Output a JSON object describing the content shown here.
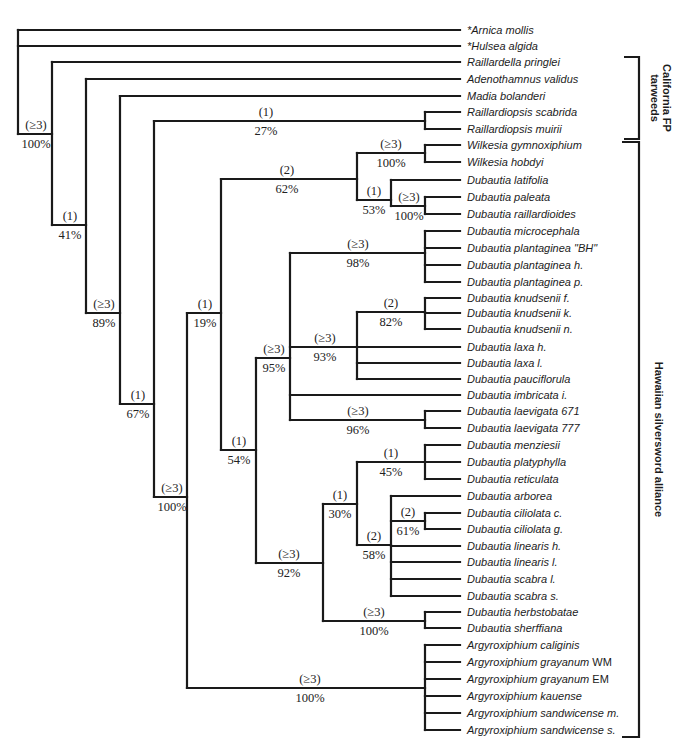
{
  "figure": {
    "type": "phylogenetic-cladogram",
    "support_legend": {
      "decay_index_format": "(n)",
      "bootstrap_format": "n%"
    }
  },
  "leaves": [
    {
      "id": "arnica",
      "label": "*Arnica mollis",
      "y": 30
    },
    {
      "id": "hulsea",
      "label": "*Hulsea algida",
      "y": 46
    },
    {
      "id": "raillardella",
      "label": "Raillardella pringlei",
      "y": 62
    },
    {
      "id": "adenothamnus",
      "label": "Adenothamnus validus",
      "y": 79
    },
    {
      "id": "madia",
      "label": "Madia bolanderi",
      "y": 96
    },
    {
      "id": "rscabrida",
      "label": "Raillardiopsis scabrida",
      "y": 112
    },
    {
      "id": "rmuirii",
      "label": "Raillardiopsis muirii",
      "y": 129
    },
    {
      "id": "wgymno",
      "label": "Wilkesia gymnoxiphium",
      "y": 145
    },
    {
      "id": "whobdyi",
      "label": "Wilkesia hobdyi",
      "y": 162
    },
    {
      "id": "dlatifolia",
      "label": "Dubautia latifolia",
      "y": 180
    },
    {
      "id": "dpaleata",
      "label": "Dubautia paleata",
      "y": 197
    },
    {
      "id": "draill",
      "label": "Dubautia  raillardioides",
      "y": 214
    },
    {
      "id": "dmicro",
      "label": "Dubautia microcephala",
      "y": 231
    },
    {
      "id": "dplantBH",
      "label": "Dubautia plantaginea \"BH\"",
      "y": 248
    },
    {
      "id": "dplanth",
      "label": "Dubautia plantaginea h.",
      "y": 265
    },
    {
      "id": "dplantp",
      "label": "Dubautia plantaginea p.",
      "y": 282
    },
    {
      "id": "dknudf",
      "label": "Dubautia knudsenii f.",
      "y": 298
    },
    {
      "id": "dknudk",
      "label": "Dubautia knudsenii k.",
      "y": 313
    },
    {
      "id": "dknudn",
      "label": "Dubautia knudsenii n.",
      "y": 329
    },
    {
      "id": "dlaxah",
      "label": "Dubautia laxa h.",
      "y": 347
    },
    {
      "id": "dlaxal",
      "label": "Dubautia laxa l.",
      "y": 363
    },
    {
      "id": "dpauci",
      "label": "Dubautia pauciflorula",
      "y": 379
    },
    {
      "id": "dimbric",
      "label": "Dubautia imbricata i.",
      "y": 395
    },
    {
      "id": "dlaev671",
      "label": "Dubautia laevigata 671",
      "y": 411
    },
    {
      "id": "dlaev777",
      "label": "Dubautia laevigata 777",
      "y": 428
    },
    {
      "id": "dmenz",
      "label": "Dubautia menziesii",
      "y": 445
    },
    {
      "id": "dplaty",
      "label": "Dubautia platyphylla",
      "y": 462
    },
    {
      "id": "dretic",
      "label": "Dubautia reticulata",
      "y": 479
    },
    {
      "id": "darbor",
      "label": "Dubautia arborea",
      "y": 496
    },
    {
      "id": "dcilc",
      "label": "Dubautia ciliolata c.",
      "y": 513
    },
    {
      "id": "dcilg",
      "label": "Dubautia ciliolata g.",
      "y": 529
    },
    {
      "id": "dlinh",
      "label": "Dubautia linearis h.",
      "y": 546
    },
    {
      "id": "dlinl",
      "label": "Dubautia linearis l.",
      "y": 562
    },
    {
      "id": "dscabl",
      "label": "Dubautia scabra l.",
      "y": 579
    },
    {
      "id": "dscabs",
      "label": "Dubautia scabra s.",
      "y": 596
    },
    {
      "id": "dherb",
      "label": "Dubautia herbstobatae",
      "y": 612
    },
    {
      "id": "dsherf",
      "label": "Dubautia sherffiana",
      "y": 628
    },
    {
      "id": "acalig",
      "label": "Argyroxiphium caliginis",
      "y": 645
    },
    {
      "id": "agrayWM",
      "label": "Argyroxiphium grayanum",
      "suffix": " WM",
      "y": 662
    },
    {
      "id": "agrayEM",
      "label": "Argyroxiphium grayanum",
      "suffix": " EM",
      "y": 679
    },
    {
      "id": "akau",
      "label": "Argyroxiphium kauense",
      "y": 696
    },
    {
      "id": "asandm",
      "label": "Argyroxiphium sandwicense m.",
      "y": 713
    },
    {
      "id": "asands",
      "label": "Argyroxiphium sandwicense s.",
      "y": 730
    }
  ],
  "leaf_line_end_x": 460,
  "label_x": 467,
  "nodes": [
    {
      "id": "root",
      "x": 18,
      "y1": 30,
      "y2": 134,
      "children": [
        "leaf:arnica",
        "leaf:hulsea",
        "node:n100a"
      ]
    },
    {
      "id": "n100a",
      "x": 52,
      "y1": 62,
      "y2": 225,
      "stem_y": 134,
      "decay": "(≥3)",
      "bootstrap": "100%",
      "children": [
        "leaf:raillardella",
        "node:n41"
      ]
    },
    {
      "id": "n41",
      "x": 86,
      "y1": 79,
      "y2": 313,
      "stem_y": 225,
      "decay": "(1)",
      "bootstrap": "41%",
      "children": [
        "leaf:adenothamnus",
        "node:n89"
      ]
    },
    {
      "id": "n89",
      "x": 120,
      "y1": 96,
      "y2": 404,
      "stem_y": 313,
      "decay": "(≥3)",
      "bootstrap": "89%",
      "children": [
        "leaf:madia",
        "node:n67"
      ]
    },
    {
      "id": "n67",
      "x": 154,
      "y1": 121,
      "y2": 497,
      "stem_y": 404,
      "decay": "(1)",
      "bootstrap": "67%",
      "children": [
        "node:n27",
        "node:n100hsa"
      ]
    },
    {
      "id": "n27",
      "x": 425,
      "y1": 112,
      "y2": 129,
      "stem_y": 121,
      "decay": "(1)",
      "bootstrap": "27%",
      "children": [
        "leaf:rscabrida",
        "leaf:rmuirii"
      ]
    },
    {
      "id": "n100hsa",
      "x": 187,
      "y1": 313,
      "y2": 688,
      "stem_y": 497,
      "decay": "(≥3)",
      "bootstrap": "100%",
      "children": [
        "node:n19",
        "node:nArgy"
      ]
    },
    {
      "id": "n19",
      "x": 221,
      "y1": 179,
      "y2": 450,
      "stem_y": 313,
      "decay": "(1)",
      "bootstrap": "19%",
      "children": [
        "node:n62",
        "node:n54"
      ]
    },
    {
      "id": "n62",
      "x": 357,
      "y1": 153,
      "y2": 200,
      "stem_y": 179,
      "decay": "(2)",
      "bootstrap": "62%",
      "children": [
        "node:nWilk",
        "node:n53"
      ]
    },
    {
      "id": "nWilk",
      "x": 425,
      "y1": 145,
      "y2": 162,
      "stem_y": 153,
      "decay": "(≥3)",
      "bootstrap": "100%",
      "children": [
        "leaf:wgymno",
        "leaf:whobdyi"
      ]
    },
    {
      "id": "n53",
      "x": 391,
      "y1": 180,
      "y2": 206,
      "stem_y": 200,
      "decay": "(1)",
      "bootstrap": "53%",
      "children": [
        "leaf:dlatifolia",
        "node:nPal"
      ]
    },
    {
      "id": "nPal",
      "x": 425,
      "y1": 197,
      "y2": 214,
      "stem_y": 206,
      "decay": "(≥3)",
      "bootstrap": "100%",
      "children": [
        "leaf:dpaleata",
        "leaf:draill"
      ]
    },
    {
      "id": "n54",
      "x": 256,
      "y1": 358,
      "y2": 563,
      "stem_y": 450,
      "decay": "(1)",
      "bootstrap": "54%",
      "children": [
        "node:n95",
        "node:n92"
      ]
    },
    {
      "id": "n95",
      "x": 290,
      "y1": 253,
      "y2": 420,
      "stem_y": 358,
      "decay": "(≥3)",
      "bootstrap": "95%",
      "children": [
        "node:n98",
        "node:n93",
        "leaf:dimbric",
        "node:n96"
      ]
    },
    {
      "id": "n98",
      "x": 425,
      "y1": 231,
      "y2": 282,
      "stem_y": 253,
      "decay": "(≥3)",
      "bootstrap": "98%",
      "children": [
        "leaf:dmicro",
        "leaf:dplantBH",
        "leaf:dplanth",
        "leaf:dplantp"
      ]
    },
    {
      "id": "n93",
      "x": 357,
      "y1": 312,
      "y2": 379,
      "stem_y": 347,
      "decay": "(≥3)",
      "bootstrap": "93%",
      "children": [
        "node:n82",
        "leaf:dlaxah",
        "leaf:dlaxal",
        "leaf:dpauci"
      ]
    },
    {
      "id": "n82",
      "x": 425,
      "y1": 298,
      "y2": 329,
      "stem_y": 312,
      "decay": "(2)",
      "bootstrap": "82%",
      "children": [
        "leaf:dknudf",
        "leaf:dknudk",
        "leaf:dknudn"
      ]
    },
    {
      "id": "n96",
      "x": 425,
      "y1": 411,
      "y2": 428,
      "stem_y": 420,
      "decay": "(≥3)",
      "bootstrap": "96%",
      "children": [
        "leaf:dlaev671",
        "leaf:dlaev777"
      ]
    },
    {
      "id": "n92",
      "x": 323,
      "y1": 504,
      "y2": 621,
      "stem_y": 563,
      "decay": "(≥3)",
      "bootstrap": "92%",
      "children": [
        "node:n30",
        "node:nHerb"
      ]
    },
    {
      "id": "n30",
      "x": 357,
      "y1": 462,
      "y2": 545,
      "stem_y": 504,
      "decay": "(1)",
      "bootstrap": "30%",
      "children": [
        "node:n45",
        "node:n58"
      ]
    },
    {
      "id": "n45",
      "x": 425,
      "y1": 445,
      "y2": 479,
      "stem_y": 462,
      "decay": "(1)",
      "bootstrap": "45%",
      "children": [
        "leaf:dmenz",
        "leaf:dplaty",
        "leaf:dretic"
      ]
    },
    {
      "id": "n58",
      "x": 391,
      "y1": 496,
      "y2": 596,
      "stem_y": 545,
      "decay": "(2)",
      "bootstrap": "58%",
      "children": [
        "leaf:darbor",
        "node:n61",
        "leaf:dlinh",
        "leaf:dlinl",
        "leaf:dscabl",
        "leaf:dscabs"
      ]
    },
    {
      "id": "n61",
      "x": 425,
      "y1": 513,
      "y2": 529,
      "stem_y": 521,
      "decay": "(2)",
      "bootstrap": "61%",
      "children": [
        "leaf:dcilc",
        "leaf:dcilg"
      ]
    },
    {
      "id": "nHerb",
      "x": 425,
      "y1": 612,
      "y2": 628,
      "stem_y": 621,
      "decay": "(≥3)",
      "bootstrap": "100%",
      "children": [
        "leaf:dherb",
        "leaf:dsherf"
      ]
    },
    {
      "id": "nArgy",
      "x": 425,
      "y1": 645,
      "y2": 730,
      "stem_y": 688,
      "decay": "(≥3)",
      "bootstrap": "100%",
      "children": [
        "leaf:acalig",
        "leaf:agrayWM",
        "leaf:agrayEM",
        "leaf:akau",
        "leaf:asandm",
        "leaf:asands"
      ]
    }
  ],
  "groups": [
    {
      "id": "california",
      "lines": [
        "California FP",
        "tarweeds"
      ],
      "bracket_x": 639,
      "y1": 57,
      "y2": 139,
      "tick_x": 624
    },
    {
      "id": "hawaiian",
      "lines": [
        "Hawaiian  silversword  alliance"
      ],
      "bracket_x": 639,
      "y1": 142,
      "y2": 737,
      "tick_x": 622
    }
  ]
}
